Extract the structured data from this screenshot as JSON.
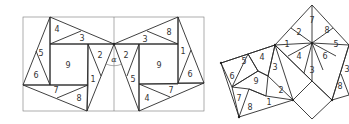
{
  "figures": [
    {
      "name": "left-dissection",
      "description": "Two mirrored dissections in a rectangle around angle alpha",
      "angle_label": "α",
      "labels": [
        {
          "text": "4",
          "x": 57,
          "y": 29
        },
        {
          "text": "3",
          "x": 82,
          "y": 38
        },
        {
          "text": "5",
          "x": 41,
          "y": 53
        },
        {
          "text": "6",
          "x": 36,
          "y": 75
        },
        {
          "text": "9",
          "x": 68,
          "y": 65
        },
        {
          "text": "2",
          "x": 100,
          "y": 55
        },
        {
          "text": "1",
          "x": 93,
          "y": 79
        },
        {
          "text": "7",
          "x": 56,
          "y": 90
        },
        {
          "text": "8",
          "x": 79,
          "y": 98
        },
        {
          "text": "2",
          "x": 126,
          "y": 55
        },
        {
          "text": "5",
          "x": 133,
          "y": 79
        },
        {
          "text": "3",
          "x": 145,
          "y": 39
        },
        {
          "text": "8",
          "x": 169,
          "y": 32
        },
        {
          "text": "9",
          "x": 159,
          "y": 65
        },
        {
          "text": "1",
          "x": 183,
          "y": 51
        },
        {
          "text": "6",
          "x": 190,
          "y": 74
        },
        {
          "text": "7",
          "x": 171,
          "y": 90
        },
        {
          "text": "4",
          "x": 147,
          "y": 98
        }
      ]
    },
    {
      "name": "right-dissection",
      "description": "Pieces rearranged around a rotated square",
      "labels": [
        {
          "text": "5",
          "x": 244,
          "y": 61
        },
        {
          "text": "4",
          "x": 262,
          "y": 57
        },
        {
          "text": "6",
          "x": 232,
          "y": 76
        },
        {
          "text": "9",
          "x": 256,
          "y": 81
        },
        {
          "text": "3",
          "x": 275,
          "y": 67
        },
        {
          "text": "7",
          "x": 239,
          "y": 98
        },
        {
          "text": "8",
          "x": 250,
          "y": 107
        },
        {
          "text": "2",
          "x": 281,
          "y": 90
        },
        {
          "text": "1",
          "x": 269,
          "y": 102
        },
        {
          "text": "7",
          "x": 312,
          "y": 20
        },
        {
          "text": "2",
          "x": 299,
          "y": 32
        },
        {
          "text": "8",
          "x": 327,
          "y": 30
        },
        {
          "text": "1",
          "x": 287,
          "y": 44
        },
        {
          "text": "5",
          "x": 336,
          "y": 44
        },
        {
          "text": "4",
          "x": 299,
          "y": 56
        },
        {
          "text": "6",
          "x": 325,
          "y": 56
        },
        {
          "text": "3",
          "x": 312,
          "y": 70
        },
        {
          "text": "3",
          "x": 347,
          "y": 69
        },
        {
          "text": "8",
          "x": 340,
          "y": 86
        }
      ]
    }
  ]
}
